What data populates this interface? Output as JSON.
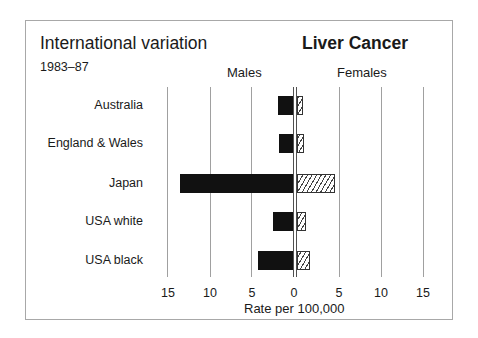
{
  "chart_data": {
    "type": "bar",
    "orientation": "horizontal-back-to-back",
    "title": "Liver Cancer",
    "subtitle": "International variation",
    "period": "1983-87",
    "xlabel": "Rate per 100,000",
    "ylabel": "",
    "categories": [
      "Australia",
      "England & Wales",
      "Japan",
      "USA white",
      "USA black"
    ],
    "series": [
      {
        "name": "Males",
        "values": [
          1.8,
          1.7,
          13.4,
          2.4,
          4.2
        ],
        "color": "#111111",
        "fill": "solid"
      },
      {
        "name": "Females",
        "values": [
          0.7,
          0.8,
          4.5,
          1.1,
          1.5
        ],
        "color": "#444444",
        "fill": "hatched"
      }
    ],
    "xlim": [
      0,
      15
    ],
    "x_ticks_left": [
      "15",
      "10",
      "5",
      "0"
    ],
    "x_ticks_right": [
      "5",
      "10",
      "15"
    ],
    "grid": true
  },
  "labels": {
    "title_left": "International variation",
    "period": "1983–87",
    "title_right": "Liver Cancer",
    "males": "Males",
    "females": "Females",
    "xlabel": "Rate per 100,000"
  }
}
